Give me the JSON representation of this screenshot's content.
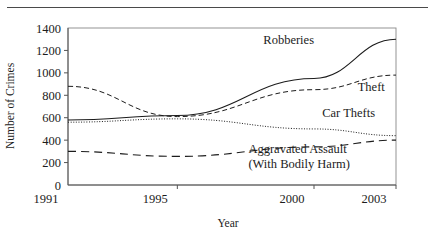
{
  "figure": {
    "top_rule": true,
    "background": "#ffffff",
    "ink_color": "#1c1c1c"
  },
  "chart_data": {
    "type": "line",
    "title": "",
    "xlabel": "Year",
    "ylabel": "Number of Crimes",
    "x": [
      1991,
      1995,
      2000,
      2003
    ],
    "xtick_labels": [
      "1991",
      "1995",
      "2000",
      "2003"
    ],
    "xlim": [
      1991,
      2003
    ],
    "ylim": [
      0,
      1400
    ],
    "ytick_values": [
      0,
      200,
      400,
      600,
      800,
      1000,
      1200,
      1400
    ],
    "ytick_labels": [
      "0",
      "200",
      "400",
      "600",
      "800",
      "1000",
      "1200",
      "1400"
    ],
    "grid": false,
    "legend": "inline-labels",
    "series": [
      {
        "name": "Robberies",
        "label": "Robberies",
        "dash": "solid",
        "values": [
          580,
          620,
          950,
          1300
        ],
        "label_x": 2000,
        "label_y": 1255,
        "label_anchor": "end"
      },
      {
        "name": "Theft",
        "label": "Theft",
        "dash": "dashed",
        "values": [
          880,
          610,
          850,
          980
        ],
        "label_x": 2001.6,
        "label_y": 840,
        "label_anchor": "start"
      },
      {
        "name": "Car Thefts",
        "label": "Car Thefts",
        "dash": "dotted",
        "values": [
          560,
          590,
          500,
          440
        ],
        "label_x": 2000.3,
        "label_y": 610,
        "label_anchor": "start"
      },
      {
        "name": "Aggravated Assault",
        "label": "Aggravated Assault",
        "label_line2": "(With Bodily Harm)",
        "dash": "longdash",
        "values": [
          300,
          255,
          340,
          400
        ],
        "label_x": 1997.6,
        "label_y": 285,
        "label_anchor": "start"
      }
    ]
  }
}
